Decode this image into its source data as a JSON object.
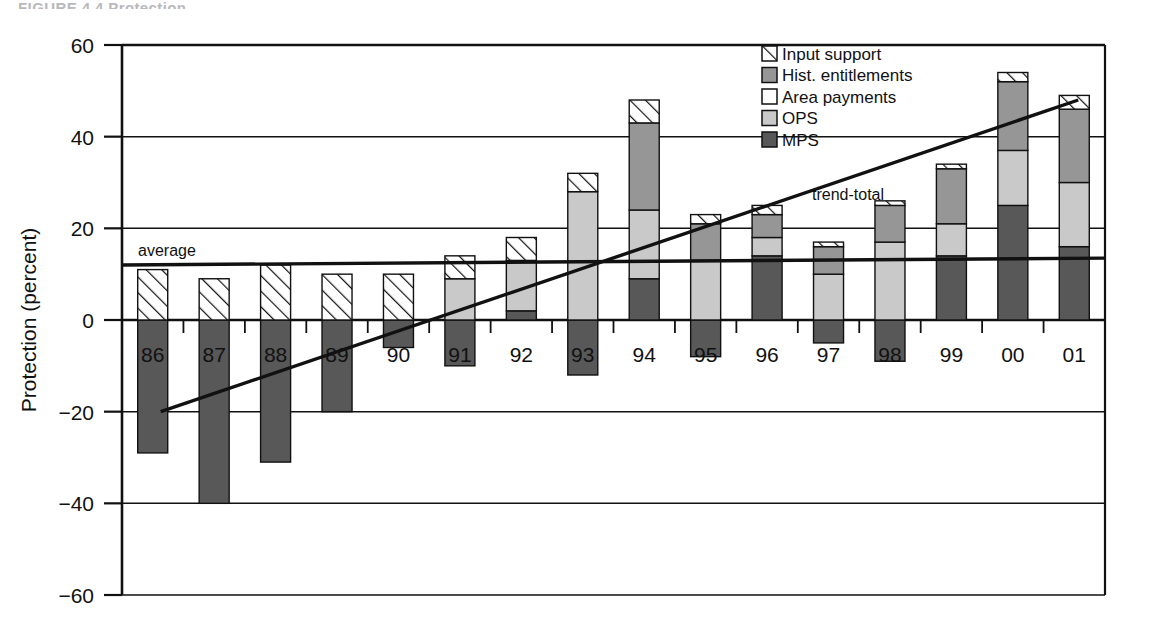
{
  "figure": {
    "partial_title": "FIGURE 4.4   Protection",
    "background": "#ffffff",
    "axis_color": "#111111"
  },
  "chart_data": {
    "type": "bar",
    "subtype": "stacked-bar-with-negative-segments",
    "title": "",
    "xlabel": "",
    "ylabel": "Protection (percent)",
    "ylim": [
      -60,
      60
    ],
    "yticks": [
      60,
      40,
      20,
      0,
      -20,
      -40,
      -60
    ],
    "ytick_labels": [
      "60",
      "40",
      "20",
      "0",
      "−20",
      "−40",
      "−60"
    ],
    "grid": true,
    "grid_axis": "y",
    "legend_position": "top-right",
    "categories": [
      "86",
      "87",
      "88",
      "89",
      "90",
      "91",
      "92",
      "93",
      "94",
      "95",
      "96",
      "97",
      "98",
      "99",
      "00",
      "01"
    ],
    "series": [
      {
        "name": "MPS",
        "fill": "#585858",
        "pattern": "solid-dark",
        "values": [
          -29,
          -40,
          -31,
          -20,
          -6,
          -10,
          2,
          -12,
          9,
          -8,
          14,
          -5,
          -9,
          14,
          25,
          16
        ]
      },
      {
        "name": "OPS",
        "fill": "#c9c9c9",
        "pattern": "solid-light",
        "values": [
          0,
          0,
          0,
          0,
          0,
          9,
          11,
          28,
          15,
          13,
          4,
          10,
          17,
          7,
          12,
          14
        ]
      },
      {
        "name": "Area payments",
        "fill": "#ffffff",
        "pattern": "solid-white",
        "values": [
          0,
          0,
          0,
          0,
          0,
          0,
          0,
          0,
          0,
          0,
          0,
          0,
          0,
          0,
          0,
          0
        ]
      },
      {
        "name": "Hist. entitlements",
        "fill": "#969696",
        "pattern": "solid-medium",
        "values": [
          0,
          0,
          0,
          0,
          0,
          0,
          0,
          0,
          19,
          8,
          5,
          6,
          8,
          12,
          15,
          16
        ]
      },
      {
        "name": "Input support",
        "fill": "#ffffff",
        "pattern": "diagonal-hatch",
        "values": [
          11,
          9,
          12,
          10,
          10,
          5,
          5,
          4,
          5,
          2,
          2,
          1,
          1,
          1,
          2,
          3
        ]
      }
    ],
    "stack_tops": [
      11,
      9,
      12,
      10,
      10,
      14,
      23,
      32,
      39,
      23,
      27,
      12,
      17,
      33,
      54,
      49
    ],
    "stack_bottoms": [
      -29,
      -40,
      -31,
      -20,
      -6,
      -10,
      0,
      -12,
      0,
      -8,
      0,
      -5,
      -9,
      0,
      0,
      0
    ],
    "annotations": [
      {
        "name": "average",
        "label": "average",
        "type": "line",
        "x_start_category": "86",
        "x_end_category": "01",
        "y_start": 12.0,
        "y_end": 13.5,
        "label_position": "above-left"
      },
      {
        "name": "trend-total",
        "label": "trend-total",
        "type": "line",
        "x_start_category": "86",
        "x_end_category": "01",
        "y_start": -20,
        "y_end": 48,
        "label_position": "above-right"
      }
    ]
  },
  "legend": {
    "title": "",
    "items": [
      {
        "label": "Input support",
        "swatch": "diagonal-hatch",
        "color": "#ffffff"
      },
      {
        "label": "Hist. entitlements",
        "swatch": "solid-medium",
        "color": "#969696"
      },
      {
        "label": "Area payments",
        "swatch": "solid-white",
        "color": "#ffffff"
      },
      {
        "label": "OPS",
        "swatch": "solid-light",
        "color": "#c9c9c9"
      },
      {
        "label": "MPS",
        "swatch": "solid-dark",
        "color": "#585858"
      }
    ]
  },
  "axis": {
    "y_title": "Protection (percent)",
    "y_tick_labels": [
      "60",
      "40",
      "20",
      "0",
      "−20",
      "−40",
      "−60"
    ],
    "x_tick_labels": [
      "86",
      "87",
      "88",
      "89",
      "90",
      "91",
      "92",
      "93",
      "94",
      "95",
      "96",
      "97",
      "98",
      "99",
      "00",
      "01"
    ]
  }
}
